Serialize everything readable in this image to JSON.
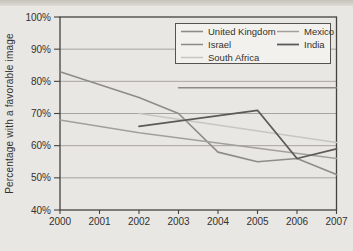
{
  "page": {
    "background": "#e9e7e3",
    "top_edge_color": "#c6c3bd"
  },
  "chart_data": {
    "type": "line",
    "title": "",
    "xlabel": "",
    "ylabel": "Percentage with a favorable image",
    "xlim": [
      2000,
      2007
    ],
    "ylim": [
      40,
      100
    ],
    "grid": "horizontal",
    "legend_position": "top-right",
    "axis_color": "#44423e",
    "grid_color": "#a6a4a0",
    "text_color": "#33312d",
    "legend_fill": "#f2f1ee",
    "legend_border": "#55534f",
    "x_tick_values": [
      2000,
      2001,
      2002,
      2003,
      2004,
      2005,
      2006,
      2007
    ],
    "x_tick_labels": [
      "2000",
      "2001",
      "2002",
      "2003",
      "2004",
      "2005",
      "2006",
      "2007"
    ],
    "y_tick_values": [
      100,
      90,
      80,
      70,
      60,
      50,
      40
    ],
    "y_tick_labels": [
      "100%",
      "90%",
      "80%",
      "70%",
      "60%",
      "50%",
      "40%"
    ],
    "series": [
      {
        "name": "United Kingdom",
        "color": "#8e8c88",
        "width": 1.6,
        "points": [
          [
            2000,
            83
          ],
          [
            2002,
            75
          ],
          [
            2003,
            70
          ],
          [
            2004,
            58
          ],
          [
            2005,
            55
          ],
          [
            2006,
            56
          ],
          [
            2007,
            51
          ]
        ]
      },
      {
        "name": "Israel",
        "color": "#8c8a86",
        "width": 1.5,
        "points": [
          [
            2003,
            78
          ],
          [
            2007,
            78
          ]
        ]
      },
      {
        "name": "South Africa",
        "color": "#c8c6c1",
        "width": 1.5,
        "points": [
          [
            2002,
            70
          ],
          [
            2007,
            61
          ]
        ]
      },
      {
        "name": "Mexico",
        "color": "#a2a09c",
        "width": 1.5,
        "points": [
          [
            2000,
            68
          ],
          [
            2002,
            64
          ],
          [
            2007,
            56
          ]
        ]
      },
      {
        "name": "India",
        "color": "#5d5b57",
        "width": 1.8,
        "points": [
          [
            2002,
            66
          ],
          [
            2005,
            71
          ],
          [
            2006,
            56
          ],
          [
            2007,
            59
          ]
        ]
      }
    ],
    "legend_columns": [
      [
        "United Kingdom",
        "Israel",
        "South Africa"
      ],
      [
        "Mexico",
        "India"
      ]
    ]
  }
}
